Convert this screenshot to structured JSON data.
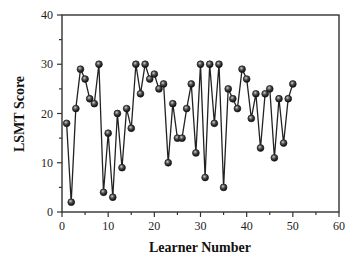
{
  "chart_data": {
    "type": "line",
    "title": "",
    "xlabel": "Learner Number",
    "ylabel": "LSMT Score",
    "xlim": [
      0,
      60
    ],
    "ylim": [
      0,
      40
    ],
    "xticks": [
      0,
      10,
      20,
      30,
      40,
      50,
      60
    ],
    "yticks": [
      0,
      10,
      20,
      30,
      40
    ],
    "x_minor_step": 5,
    "y_minor_step": 5,
    "grid": false,
    "legend": null,
    "marker": "shaded-circle",
    "series": [
      {
        "name": "LSMT Score",
        "x": [
          1,
          2,
          3,
          4,
          5,
          6,
          7,
          8,
          9,
          10,
          11,
          12,
          13,
          14,
          15,
          16,
          17,
          18,
          19,
          20,
          21,
          22,
          23,
          24,
          25,
          26,
          27,
          28,
          29,
          30,
          31,
          32,
          33,
          34,
          35,
          36,
          37,
          38,
          39,
          40,
          41,
          42,
          43,
          44,
          45,
          46,
          47,
          48,
          49,
          50
        ],
        "values": [
          18,
          2,
          21,
          29,
          27,
          23,
          22,
          30,
          4,
          16,
          3,
          20,
          9,
          21,
          17,
          30,
          24,
          30,
          27,
          28,
          25,
          26,
          10,
          22,
          15,
          15,
          21,
          26,
          12,
          30,
          7,
          30,
          18,
          30,
          5,
          25,
          23,
          21,
          29,
          27,
          19,
          24,
          13,
          24,
          25,
          11,
          23,
          14,
          23,
          26
        ]
      }
    ]
  },
  "labels": {
    "xlabel": "Learner Number",
    "ylabel": "LSMT Score",
    "xticks": [
      "0",
      "10",
      "20",
      "30",
      "40",
      "50",
      "60"
    ],
    "yticks": [
      "0",
      "10",
      "20",
      "30",
      "40"
    ]
  },
  "colors": {
    "axis": "#333333",
    "line": "#222222",
    "marker": "#1a1a1a",
    "marker_highlight": "#bbbbbb"
  }
}
